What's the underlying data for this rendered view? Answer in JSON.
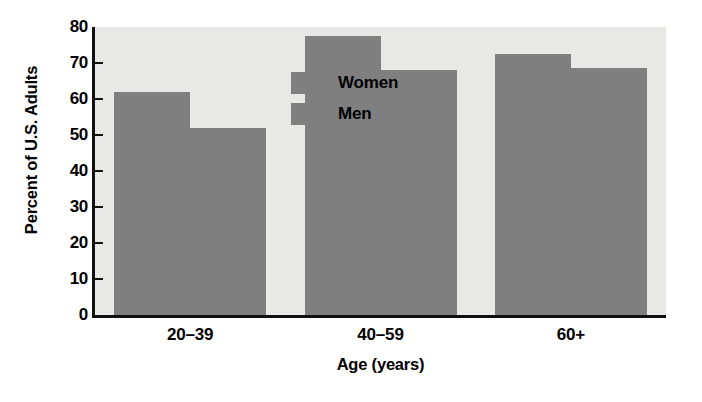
{
  "chart_data": {
    "type": "bar",
    "title": "",
    "subtitle": "",
    "categories": [
      "20–39",
      "40–59",
      "60+"
    ],
    "series": [
      {
        "name": "Women",
        "values": [
          62,
          77.5,
          72.5
        ],
        "color": "#7f7f7f"
      },
      {
        "name": "Men",
        "values": [
          52,
          68,
          68.5
        ],
        "color": "#7f7f7f"
      }
    ],
    "xlabel": "Age (years)",
    "ylabel": "Percent of U.S. Adults",
    "ylim": [
      0,
      80
    ],
    "ytick_values": [
      0,
      10,
      20,
      30,
      40,
      50,
      60,
      70,
      80
    ],
    "ytick_labels": [
      "0",
      "10",
      "20",
      "30",
      "40",
      "50",
      "60",
      "70",
      "80"
    ],
    "grid": false,
    "legend_position": "inside-top-left",
    "plot_background": "#e8e8e6",
    "axis_color": "#111111",
    "bar_color": "#7f7f7f"
  },
  "legend": {
    "items": [
      {
        "label": "Women"
      },
      {
        "label": "Men"
      }
    ]
  },
  "axes": {
    "y_title": "Percent of U.S. Adults",
    "x_title": "Age (years)"
  }
}
